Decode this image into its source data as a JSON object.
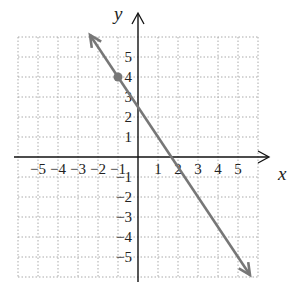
{
  "chart_data": {
    "type": "line",
    "title": "",
    "xlabel": "x",
    "ylabel": "y",
    "xlim": [
      -6,
      6
    ],
    "ylim": [
      -6,
      6
    ],
    "grid": true,
    "x_ticks": [
      "−5",
      "−4",
      "−3",
      "−2",
      "−1",
      "1",
      "2",
      "3",
      "4",
      "5"
    ],
    "y_ticks": [
      "5",
      "4",
      "3",
      "2",
      "1",
      "−1",
      "−2",
      "−3",
      "−4",
      "−5"
    ],
    "series": [
      {
        "name": "line",
        "equation": "y = -3/2 x + 5/2",
        "slope": -1.5,
        "intercept": 2.5,
        "x": [
          -2.4,
          5.6
        ],
        "y": [
          6.1,
          -5.9
        ],
        "arrows": "both",
        "color": "#777777"
      }
    ],
    "points": [
      {
        "x": -1,
        "y": 4,
        "color": "#777777"
      }
    ]
  }
}
